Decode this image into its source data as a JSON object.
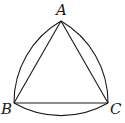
{
  "diagram": {
    "type": "reuleaux-triangle",
    "vertices": [
      {
        "label": "A",
        "x": 61,
        "y": 21
      },
      {
        "label": "B",
        "x": 14,
        "y": 103
      },
      {
        "label": "C",
        "x": 108,
        "y": 103
      }
    ],
    "labels": {
      "A": "A",
      "B": "B",
      "C": "C"
    },
    "stroke_color": "#1a1a1a",
    "segments": [
      "AB",
      "BC",
      "CA"
    ],
    "arcs": [
      {
        "from": "A",
        "to": "B",
        "center": "C"
      },
      {
        "from": "B",
        "to": "C",
        "center": "A"
      },
      {
        "from": "C",
        "to": "A",
        "center": "B"
      }
    ]
  }
}
